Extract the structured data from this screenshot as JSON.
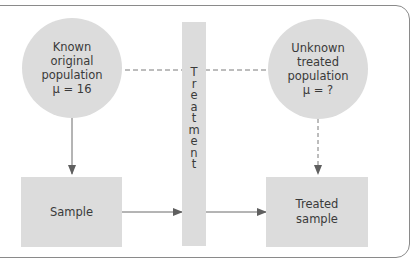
{
  "diagram": {
    "type": "experimental-design-flow",
    "known_population": {
      "lines": [
        "Known",
        "original",
        "population",
        "μ = 16"
      ]
    },
    "unknown_population": {
      "lines": [
        "Unknown",
        "treated",
        "population",
        "μ = ?"
      ]
    },
    "treatment": {
      "label": "Treatment",
      "letters": [
        "T",
        "r",
        "e",
        "a",
        "t",
        "m",
        "e",
        "n",
        "t"
      ]
    },
    "sample": {
      "label": "Sample"
    },
    "treated_sample": {
      "lines": [
        "Treated",
        "sample"
      ]
    },
    "connections": [
      {
        "from": "known_population",
        "to": "unknown_population",
        "style": "dashed",
        "arrow": false
      },
      {
        "from": "known_population",
        "to": "sample",
        "style": "solid",
        "arrow": true
      },
      {
        "from": "sample",
        "to": "treatment",
        "style": "solid",
        "arrow": true
      },
      {
        "from": "treatment",
        "to": "treated_sample",
        "style": "solid",
        "arrow": true
      },
      {
        "from": "unknown_population",
        "to": "treated_sample",
        "style": "dashed",
        "arrow": true
      }
    ],
    "colors": {
      "shape_fill": "#dcdcdc",
      "line": "#6b6b6b",
      "frame": "#8a8a8a",
      "text": "#3a3a3a"
    }
  }
}
